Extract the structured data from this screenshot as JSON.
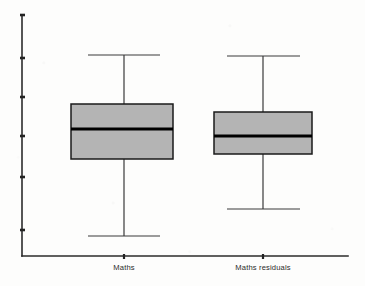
{
  "chart_data": {
    "type": "box",
    "title": "",
    "subtitle": "",
    "xlabel": "",
    "ylabel": "",
    "grid": false,
    "legend": null,
    "legend_position": "none",
    "y_axis": {
      "tick_labels": [
        "",
        "",
        "",
        "",
        "",
        ""
      ],
      "tick_pixel_y": [
        15,
        58,
        97,
        136,
        177,
        230
      ],
      "labelled": false,
      "range_note": "axis drawn with six unlabelled tick marks"
    },
    "categories": [
      "Maths",
      "Maths residuals"
    ],
    "boxes": [
      {
        "category": "Maths",
        "whisker_low_y": 236,
        "q1_y": 159,
        "median_y": 129,
        "q3_y": 104,
        "whisker_high_y": 55,
        "box_left_x": 71,
        "box_right_x": 173,
        "center_x": 124,
        "cap_left_x": 88,
        "cap_right_x": 160
      },
      {
        "category": "Maths residuals",
        "whisker_low_y": 209,
        "q1_y": 154,
        "median_y": 136,
        "q3_y": 112,
        "whisker_high_y": 56,
        "box_left_x": 214,
        "box_right_x": 312,
        "center_x": 263,
        "cap_left_x": 227,
        "cap_right_x": 300
      }
    ],
    "colors": {
      "box_fill": "#b4b4b4",
      "box_stroke": "#1a1a1a",
      "median": "#000000",
      "whisker": "#3a3a3a",
      "axis": "#2b2b2b",
      "background": "#fdfdfc",
      "text": "#2a2a2a"
    }
  },
  "axes": {
    "y_axis_x": 22,
    "y_axis_top": 15,
    "y_axis_bottom": 256,
    "x_axis_y": 256,
    "x_axis_left": 22,
    "x_axis_right": 348,
    "tick_length": 4
  },
  "labels": {
    "category_1": "Maths",
    "category_2": "Maths residuals"
  }
}
